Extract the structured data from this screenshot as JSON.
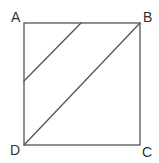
{
  "diagram": {
    "type": "geometry",
    "stroke_color": "#555555",
    "background": "#ffffff",
    "vertices": {
      "A": {
        "label": "A",
        "x": 24,
        "y": 23
      },
      "B": {
        "label": "B",
        "x": 140,
        "y": 23
      },
      "C": {
        "label": "C",
        "x": 140,
        "y": 145
      },
      "D": {
        "label": "D",
        "x": 24,
        "y": 145
      }
    },
    "segments": [
      {
        "name": "AB",
        "x1": 24,
        "y1": 23,
        "x2": 140,
        "y2": 23
      },
      {
        "name": "BC",
        "x1": 140,
        "y1": 23,
        "x2": 140,
        "y2": 145
      },
      {
        "name": "CD",
        "x1": 140,
        "y1": 145,
        "x2": 24,
        "y2": 145
      },
      {
        "name": "DA",
        "x1": 24,
        "y1": 145,
        "x2": 24,
        "y2": 23
      },
      {
        "name": "diagonal-DB",
        "x1": 24,
        "y1": 145,
        "x2": 140,
        "y2": 23
      },
      {
        "name": "parallel-segment",
        "x1": 81,
        "y1": 23,
        "x2": 24,
        "y2": 81
      }
    ]
  }
}
